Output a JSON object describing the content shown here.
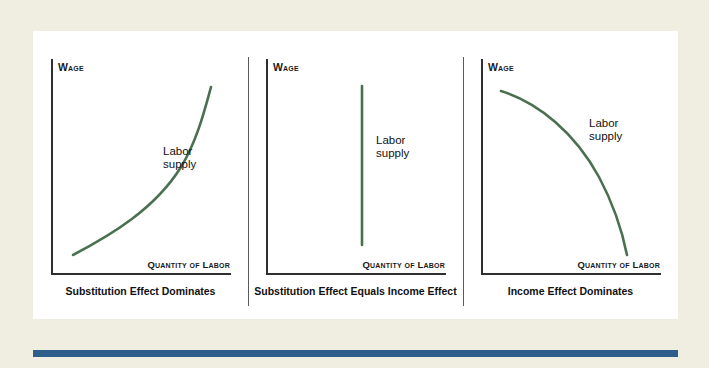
{
  "figure": {
    "background_color": "#efeee0",
    "card_color": "#ffffff",
    "accent_bar_color": "#2d5f8a",
    "curve_color": "#4a7050",
    "axis_color": "#2f2f2f"
  },
  "panels": [
    {
      "id": "substitution-effect-dominates",
      "caption": "Substitution Effect Dominates",
      "y_axis_label": "Wage",
      "x_axis_label": "Quantity of Labor",
      "curve_label": "Labor\nsupply",
      "curve_shape": "upward-sloping-convex",
      "curve_path": "M 22 196 C 60 176, 104 150, 130 108 C 146 82, 154 50, 160 28"
    },
    {
      "id": "substitution-effect-equals-income-effect",
      "caption": "Substitution Effect Equals Income Effect",
      "y_axis_label": "Wage",
      "x_axis_label": "Quantity of Labor",
      "curve_label": "Labor\nsupply",
      "curve_shape": "vertical",
      "curve_path": "M 96 27 L 96 186"
    },
    {
      "id": "income-effect-dominates",
      "caption": "Income Effect Dominates",
      "y_axis_label": "Wage",
      "x_axis_label": "Quantity of Labor",
      "curve_label": "Labor\nsupply",
      "curve_shape": "downward-sloping-concave",
      "curve_path": "M 20 32 C 58 44, 94 74, 118 118 C 134 148, 142 176, 146 196"
    }
  ],
  "chart_data": {
    "type": "line",
    "title": "",
    "xlabel": "Quantity of Labor",
    "ylabel": "Wage",
    "grid": false,
    "legend": "inline-annotation",
    "series": [
      {
        "name": "Labor supply (substitution effect dominates)",
        "panel": 0,
        "shape": "increasing convex",
        "x": [
          0.12,
          0.33,
          0.55,
          0.72,
          0.85,
          0.89
        ],
        "y": [
          0.09,
          0.2,
          0.36,
          0.55,
          0.78,
          0.87
        ]
      },
      {
        "name": "Labor supply (substitution effect equals income effect)",
        "panel": 1,
        "shape": "vertical",
        "x": [
          0.53,
          0.53
        ],
        "y": [
          0.14,
          0.88
        ]
      },
      {
        "name": "Labor supply (income effect dominates)",
        "panel": 2,
        "shape": "decreasing concave",
        "x": [
          0.11,
          0.33,
          0.55,
          0.7,
          0.78,
          0.81
        ],
        "y": [
          0.85,
          0.76,
          0.61,
          0.43,
          0.23,
          0.09
        ]
      }
    ]
  }
}
